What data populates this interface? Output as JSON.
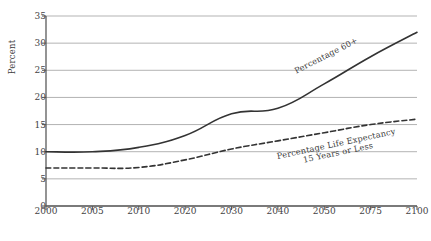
{
  "chart_data": {
    "type": "line",
    "title": "",
    "xlabel": "",
    "ylabel": "Percent",
    "categories": [
      "2000",
      "2005",
      "2010",
      "2020",
      "2030",
      "2040",
      "2050",
      "2075",
      "2100"
    ],
    "ylim": [
      0,
      35
    ],
    "yticks": [
      "0",
      "5",
      "10",
      "15",
      "20",
      "25",
      "30",
      "35"
    ],
    "grid": "horizontal",
    "legend": "inline-labels",
    "series": [
      {
        "name": "Percentage 60+",
        "style": "solid",
        "color": "#333333",
        "label_line1": "Percentage 60+",
        "values": [
          10,
          10,
          10.8,
          13,
          17,
          18,
          22.5,
          27.5,
          32
        ]
      },
      {
        "name": "Percentage Life Expectancy 15 Years or Less",
        "style": "dashed",
        "color": "#333333",
        "label_line1": "Percentage Life Expectancy",
        "label_line2": "15 Years or Less",
        "values": [
          7,
          7,
          7.1,
          8.5,
          10.5,
          12,
          13.5,
          15,
          16
        ]
      }
    ],
    "colors": {
      "background": "#ffffff",
      "axis": "#5a5a5a",
      "gridline": "#b3b3b3",
      "text": "#3b3b3b"
    }
  }
}
